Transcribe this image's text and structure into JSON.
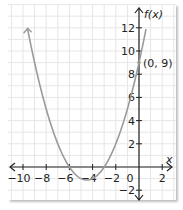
{
  "chart_data": {
    "type": "line",
    "title": "",
    "xlabel": "x",
    "ylabel": "f(x)",
    "function": "f(x) = 0.5x^2 + 4.5x + 9",
    "xlim": [
      -11,
      2.8
    ],
    "ylim": [
      -2.8,
      13
    ],
    "grid": true,
    "x_ticks": [
      -10,
      -8,
      -6,
      -4,
      -2,
      0,
      2
    ],
    "x_tick_labels": [
      "−10",
      "−8",
      "−6",
      "−4",
      "−2",
      "0",
      "2"
    ],
    "y_ticks": [
      -2,
      2,
      4,
      6,
      8,
      10,
      12
    ],
    "y_tick_labels": [
      "−2",
      "2",
      "4",
      "6",
      "8",
      "10",
      "12"
    ],
    "series": [
      {
        "name": "f(x)",
        "x": [
          -9.6,
          -9,
          -8,
          -7,
          -6,
          -5,
          -4.5,
          -4,
          -3,
          -2,
          -1,
          0,
          0.6
        ],
        "y": [
          11.88,
          9,
          5,
          2,
          0,
          -1,
          -1.125,
          -1,
          0,
          2,
          5,
          9,
          11.88
        ]
      }
    ],
    "annotations": [
      {
        "text": "(0, 9)",
        "x": 0,
        "y": 9
      }
    ],
    "colors": {
      "curve": "#9a9a9a",
      "axis": "#222222",
      "grid": "#e6e6e6"
    }
  },
  "labels": {
    "x_axis": "x",
    "y_axis": "f(x)",
    "point": "(0, 9)"
  }
}
